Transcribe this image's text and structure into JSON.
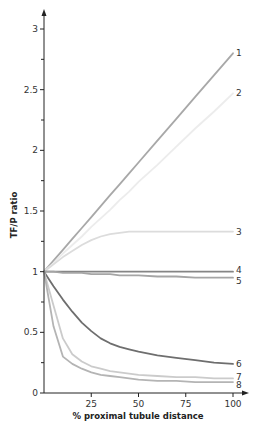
{
  "chart_data": {
    "type": "line",
    "title": "",
    "xlabel": "% proximal tubule distance",
    "ylabel": "TF/P ratio",
    "xlim": [
      0,
      100
    ],
    "ylim": [
      0,
      3
    ],
    "xticks": [
      25,
      50,
      75,
      100
    ],
    "xtick_labels": [
      "25",
      "50",
      "75",
      "100"
    ],
    "yticks": [
      0,
      0.5,
      1,
      1.5,
      2,
      2.5,
      3
    ],
    "ytick_labels": [
      "0",
      "0.5",
      "1",
      "1.5",
      "2",
      "2.5",
      "3"
    ],
    "grid": false,
    "legend": "inline numeric labels at right end of each line",
    "x": [
      0,
      5,
      10,
      15,
      20,
      25,
      30,
      35,
      40,
      45,
      50,
      60,
      70,
      80,
      90,
      100
    ],
    "series": [
      {
        "name": "1",
        "color": "#a8a8a8",
        "values": [
          1.0,
          1.09,
          1.18,
          1.27,
          1.36,
          1.45,
          1.54,
          1.63,
          1.72,
          1.81,
          1.9,
          2.08,
          2.26,
          2.44,
          2.62,
          2.8
        ]
      },
      {
        "name": "2",
        "color": "#ececec",
        "values": [
          1.0,
          1.07,
          1.15,
          1.22,
          1.29,
          1.37,
          1.44,
          1.51,
          1.59,
          1.66,
          1.74,
          1.88,
          2.03,
          2.18,
          2.32,
          2.47
        ]
      },
      {
        "name": "3",
        "color": "#dcdcdc",
        "values": [
          1.0,
          1.06,
          1.12,
          1.17,
          1.22,
          1.26,
          1.29,
          1.31,
          1.32,
          1.33,
          1.33,
          1.33,
          1.33,
          1.33,
          1.33,
          1.33
        ]
      },
      {
        "name": "4",
        "color": "#858585",
        "values": [
          1.0,
          1.0,
          1.0,
          1.0,
          1.0,
          1.0,
          1.0,
          1.0,
          1.0,
          1.0,
          1.0,
          1.0,
          1.0,
          1.0,
          1.0,
          1.0
        ]
      },
      {
        "name": "5",
        "color": "#a5a5a5",
        "values": [
          1.0,
          1.0,
          0.99,
          0.99,
          0.99,
          0.98,
          0.98,
          0.98,
          0.97,
          0.97,
          0.97,
          0.96,
          0.96,
          0.95,
          0.95,
          0.95
        ]
      },
      {
        "name": "6",
        "color": "#6e6e6e",
        "values": [
          1.0,
          0.88,
          0.77,
          0.67,
          0.58,
          0.51,
          0.45,
          0.41,
          0.38,
          0.36,
          0.34,
          0.31,
          0.29,
          0.27,
          0.25,
          0.24
        ]
      },
      {
        "name": "7",
        "color": "#cbcbcb",
        "values": [
          1.0,
          0.72,
          0.45,
          0.32,
          0.26,
          0.22,
          0.2,
          0.18,
          0.17,
          0.16,
          0.15,
          0.14,
          0.13,
          0.13,
          0.12,
          0.12
        ]
      },
      {
        "name": "8",
        "color": "#b4b4b4",
        "values": [
          1.0,
          0.55,
          0.3,
          0.24,
          0.2,
          0.17,
          0.15,
          0.14,
          0.13,
          0.12,
          0.11,
          0.1,
          0.1,
          0.09,
          0.09,
          0.09
        ]
      }
    ]
  }
}
